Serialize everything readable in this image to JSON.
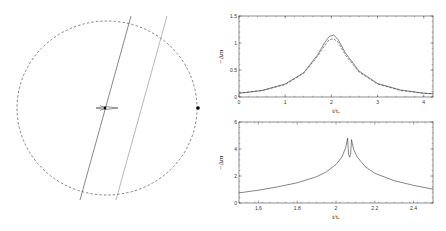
{
  "figure": {
    "left_panel": {
      "description": "caustic geometry with source trajectories",
      "circle": {
        "cx": 107,
        "cy": 108,
        "rx": 90,
        "ry": 87,
        "style": "dashed"
      },
      "trajectories": [
        {
          "x1": 131,
          "y1": 16,
          "x2": 80,
          "y2": 200,
          "color": "#555555"
        },
        {
          "x1": 167,
          "y1": 16,
          "x2": 116,
          "y2": 200,
          "color": "#999999"
        }
      ],
      "center_point": {
        "x": 105,
        "y": 108
      },
      "edge_point": {
        "x": 198,
        "y": 108
      }
    }
  },
  "chart_data": [
    {
      "type": "line",
      "title": "",
      "xlabel": "t/t_E",
      "ylabel": "−Δm",
      "xlim": [
        0,
        4.2
      ],
      "ylim": [
        0,
        1.5
      ],
      "xticks": [
        "0",
        "1",
        "2",
        "3",
        "4"
      ],
      "yticks": [
        "0",
        "0.5",
        "1",
        "1.5"
      ],
      "series": [
        {
          "name": "solid",
          "style": "solid",
          "x": [
            0,
            0.5,
            1.0,
            1.4,
            1.7,
            1.85,
            1.95,
            2.05,
            2.15,
            2.3,
            2.6,
            3.0,
            3.5,
            4.0,
            4.2
          ],
          "y": [
            0.07,
            0.12,
            0.24,
            0.45,
            0.78,
            1.0,
            1.12,
            1.15,
            1.06,
            0.82,
            0.48,
            0.25,
            0.13,
            0.07,
            0.06
          ]
        },
        {
          "name": "dashed",
          "style": "dashed",
          "x": [
            0,
            0.5,
            1.0,
            1.4,
            1.7,
            1.85,
            1.95,
            2.05,
            2.15,
            2.3,
            2.6,
            3.0,
            3.5,
            4.0,
            4.2
          ],
          "y": [
            0.07,
            0.12,
            0.23,
            0.44,
            0.75,
            0.95,
            1.06,
            1.08,
            1.01,
            0.78,
            0.46,
            0.24,
            0.12,
            0.07,
            0.06
          ]
        }
      ]
    },
    {
      "type": "line",
      "title": "",
      "xlabel": "t/t_E",
      "ylabel": "−Δm",
      "xlim": [
        1.5,
        2.5
      ],
      "ylim": [
        0,
        6
      ],
      "xticks": [
        "1.6",
        "1.8",
        "2",
        "2.2",
        "2.4"
      ],
      "yticks": [
        "0",
        "2",
        "4",
        "6"
      ],
      "series": [
        {
          "name": "solid",
          "style": "solid",
          "x": [
            1.5,
            1.6,
            1.7,
            1.8,
            1.9,
            1.95,
            2.0,
            2.03,
            2.05,
            2.06,
            2.065,
            2.07,
            2.075,
            2.08,
            2.09,
            2.11,
            2.15,
            2.2,
            2.3,
            2.4,
            2.5
          ],
          "y": [
            0.75,
            0.95,
            1.2,
            1.5,
            1.95,
            2.3,
            2.85,
            3.4,
            4.1,
            4.8,
            3.6,
            3.4,
            3.6,
            4.7,
            4.0,
            3.4,
            2.7,
            2.2,
            1.65,
            1.3,
            1.02
          ]
        }
      ]
    }
  ]
}
